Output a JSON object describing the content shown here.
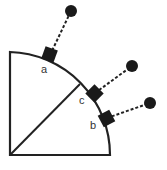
{
  "diagram": {
    "labels": {
      "a": "a",
      "b": "b",
      "c": "c"
    },
    "colors": {
      "stroke": "#222222",
      "fill": "#1a1a1a",
      "label": "#333333"
    }
  }
}
